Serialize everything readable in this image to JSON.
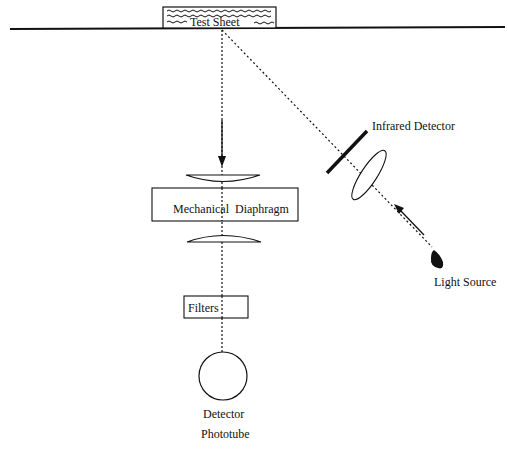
{
  "diagram": {
    "labels": {
      "test_sheet": "Test Sheet",
      "mechanical_diaphragm": "Mechanical  Diaphragm",
      "filters": "Filters",
      "detector_line1": "Detector",
      "detector_line2": "Phototube",
      "infrared_detector": "Infrared Detector",
      "light_source": "Light Source"
    },
    "colors": {
      "ink": "#111111",
      "background": "#ffffff"
    }
  }
}
